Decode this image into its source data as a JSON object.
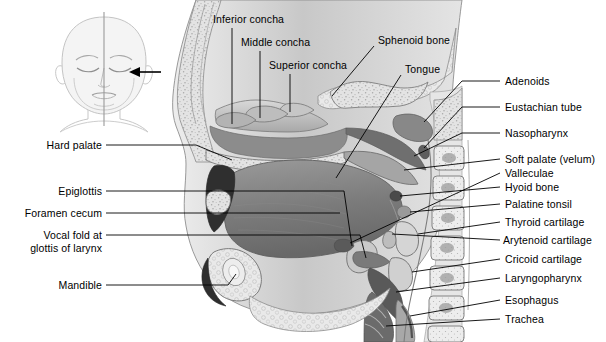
{
  "figure": {
    "background_color": "#ffffff",
    "text_color": "#000000",
    "leader_line_color": "#000000",
    "width": 606,
    "height": 342
  },
  "inset": {
    "name": "infant-head-frontal-view",
    "description": "Line drawing of an infant head, frontal view, with vertical midline and arrow indicating the plane of section",
    "arrow": "left-pointing-arrow",
    "midline": "vertical-midline"
  },
  "labels": {
    "top": [
      {
        "id": "inferior-concha",
        "text": "Inferior concha",
        "x": 213,
        "y": 19
      },
      {
        "id": "middle-concha",
        "text": "Middle concha",
        "x": 241,
        "y": 42
      },
      {
        "id": "superior-concha",
        "text": "Superior concha",
        "x": 269,
        "y": 65
      },
      {
        "id": "sphenoid-bone",
        "text": "Sphenoid bone",
        "x": 378,
        "y": 40
      },
      {
        "id": "tongue",
        "text": "Tongue",
        "x": 405,
        "y": 69
      }
    ],
    "left": [
      {
        "id": "hard-palate",
        "text": "Hard palate",
        "x": 100,
        "y": 148
      },
      {
        "id": "epiglottis",
        "text": "Epiglottis",
        "x": 100,
        "y": 194
      },
      {
        "id": "foramen-cecum",
        "text": "Foramen cecum",
        "x": 100,
        "y": 216
      },
      {
        "id": "vocal-fold",
        "text": "Vocal fold at",
        "x": 100,
        "y": 238
      },
      {
        "id": "vocal-fold-2",
        "text": "glottis of larynx",
        "x": 100,
        "y": 251
      },
      {
        "id": "mandible",
        "text": "Mandible",
        "x": 100,
        "y": 288
      }
    ],
    "right": [
      {
        "id": "adenoids",
        "text": "Adenoids",
        "x": 505,
        "y": 84
      },
      {
        "id": "eustachian-tube",
        "text": "Eustachian tube",
        "x": 505,
        "y": 110
      },
      {
        "id": "nasopharynx",
        "text": "Nasopharynx",
        "x": 505,
        "y": 136
      },
      {
        "id": "soft-palate",
        "text": "Soft palate (velum)",
        "x": 505,
        "y": 162
      },
      {
        "id": "valleculae",
        "text": "Valleculae",
        "x": 505,
        "y": 176
      },
      {
        "id": "hyoid-bone",
        "text": "Hyoid bone",
        "x": 505,
        "y": 190
      },
      {
        "id": "palatine-tonsil",
        "text": "Palatine tonsil",
        "x": 505,
        "y": 207
      },
      {
        "id": "thyroid-cartilage",
        "text": "Thyroid cartilage",
        "x": 505,
        "y": 225
      },
      {
        "id": "arytenoid-cartilage",
        "text": "Arytenoid cartilage",
        "x": 505,
        "y": 243
      },
      {
        "id": "cricoid-cartilage",
        "text": "Cricoid cartilage",
        "x": 505,
        "y": 262
      },
      {
        "id": "laryngopharynx",
        "text": "Laryngopharynx",
        "x": 505,
        "y": 281
      },
      {
        "id": "esophagus",
        "text": "Esophagus",
        "x": 505,
        "y": 303
      },
      {
        "id": "trachea",
        "text": "Trachea",
        "x": 505,
        "y": 322
      }
    ]
  },
  "palette": {
    "outline": "#3a3a3a",
    "bone_light": "#e8e8e8",
    "bone_mid": "#cfcfcf",
    "soft_tissue": "#b6b6b6",
    "tongue_dark": "#7d7d7d",
    "airway_dark": "#4f4f4f",
    "cavity_black": "#2b2b2b",
    "inset_line": "#bdbdbd"
  }
}
